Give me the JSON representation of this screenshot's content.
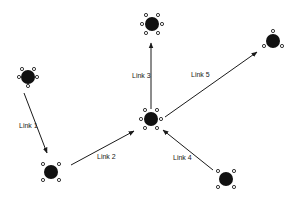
{
  "diagram": {
    "type": "network-graph",
    "background": "#ffffff",
    "node_color": "#111111",
    "port_color": "#222222",
    "edge_color": "#1a1a1a",
    "nodes": [
      {
        "id": "A",
        "x": 28,
        "y": 77,
        "r": 7,
        "ports": [
          [
            -6,
            -8
          ],
          [
            6,
            -8
          ],
          [
            -9,
            0
          ],
          [
            9,
            0
          ],
          [
            0,
            9
          ]
        ]
      },
      {
        "id": "B",
        "x": 152,
        "y": 24,
        "r": 7,
        "ports": [
          [
            -6,
            -9
          ],
          [
            6,
            -9
          ],
          [
            -10,
            0
          ],
          [
            10,
            0
          ],
          [
            -6,
            9
          ],
          [
            6,
            9
          ]
        ]
      },
      {
        "id": "C",
        "x": 273,
        "y": 41,
        "r": 7,
        "ports": [
          [
            0,
            -10
          ],
          [
            -9,
            5
          ],
          [
            9,
            5
          ]
        ]
      },
      {
        "id": "D",
        "x": 151,
        "y": 119,
        "r": 7,
        "ports": [
          [
            -6,
            -9
          ],
          [
            6,
            -9
          ],
          [
            -10,
            0
          ],
          [
            10,
            0
          ],
          [
            -6,
            9
          ],
          [
            6,
            9
          ]
        ]
      },
      {
        "id": "E",
        "x": 51,
        "y": 172,
        "r": 7,
        "ports": [
          [
            -8,
            -8
          ],
          [
            8,
            -8
          ],
          [
            -8,
            8
          ],
          [
            8,
            8
          ]
        ]
      },
      {
        "id": "F",
        "x": 226,
        "y": 179,
        "r": 7,
        "ports": [
          [
            -8,
            -8
          ],
          [
            8,
            -8
          ],
          [
            -8,
            8
          ],
          [
            8,
            8
          ]
        ]
      }
    ],
    "links": [
      {
        "label": "Link 1",
        "from": [
          24,
          93
        ],
        "to": [
          47,
          153
        ],
        "label_x": 19,
        "label_y": 122
      },
      {
        "label": "Link 2",
        "from": [
          71,
          165
        ],
        "to": [
          134,
          131
        ],
        "label_x": 97,
        "label_y": 153
      },
      {
        "label": "Link 3",
        "from": [
          151,
          109
        ],
        "to": [
          151,
          43
        ],
        "label_x": 132,
        "label_y": 72
      },
      {
        "label": "Link 4",
        "from": [
          213,
          170
        ],
        "to": [
          163,
          130
        ],
        "label_x": 173,
        "label_y": 154
      },
      {
        "label": "Link 5",
        "from": [
          165,
          117
        ],
        "to": [
          257,
          52
        ],
        "label_x": 191,
        "label_y": 71
      }
    ]
  }
}
